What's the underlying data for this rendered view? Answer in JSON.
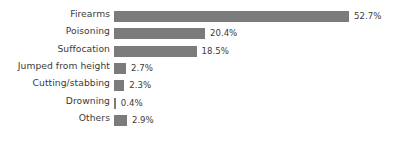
{
  "chart_data": {
    "type": "bar",
    "orientation": "horizontal",
    "title": "",
    "subtitle": "",
    "xlabel": "",
    "ylabel": "",
    "xlim": [
      0,
      52.7
    ],
    "grid": false,
    "legend": false,
    "axis_ticks_visible": false,
    "value_label_suffix": "%",
    "bar_color": "#7b7b7b",
    "text_color": "#3b3b3b",
    "background_color": "#ffffff",
    "categories": [
      "Firearms",
      "Poisoning",
      "Suffocation",
      "Jumped from height",
      "Cutting/stabbing",
      "Drowning",
      "Others"
    ],
    "values": [
      52.7,
      20.4,
      18.5,
      2.7,
      2.3,
      0.4,
      2.9
    ],
    "value_labels": [
      "52.7%",
      "20.4%",
      "18.5%",
      "2.7%",
      "2.3%",
      "0.4%",
      "2.9%"
    ],
    "bars": [
      {
        "category": "Firearms",
        "value": 52.7,
        "label": "52.7%"
      },
      {
        "category": "Poisoning",
        "value": 20.4,
        "label": "20.4%"
      },
      {
        "category": "Suffocation",
        "value": 18.5,
        "label": "18.5%"
      },
      {
        "category": "Jumped from height",
        "value": 2.7,
        "label": "2.7%"
      },
      {
        "category": "Cutting/stabbing",
        "value": 2.3,
        "label": "2.3%"
      },
      {
        "category": "Drowning",
        "value": 0.4,
        "label": "0.4%"
      },
      {
        "category": "Others",
        "value": 2.9,
        "label": "2.9%"
      }
    ]
  },
  "layout": {
    "bar_origin_x": 114,
    "px_per_unit": 4.46,
    "row_pitch": 17.3,
    "row_start_y": 8,
    "bar_height": 11
  }
}
